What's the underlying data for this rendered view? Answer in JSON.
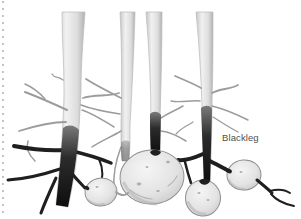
{
  "figure": {
    "label": "Blackleg",
    "alt": "Hand-drawn pencil illustration of four potato stems with blackened lower stems (blackleg disease), fibrous roots and four tubers",
    "colors": {
      "background": "#ffffff",
      "label_text": "#4f4f4f",
      "stem_edge": "#c6c6c6",
      "stem_light": "#f1f1f1",
      "stem_mid": "#dedede",
      "stem_shadow": "#b2b2b2",
      "blackleg_top": "#7a7a7a",
      "blackleg_mid": "#2b2b2b",
      "blackleg_dark": "#0e0e0e",
      "root_dark": "#1f1f1f",
      "root_light": "#9c9c9c",
      "tuber_highlight": "#f5f5f5",
      "tuber_fill": "#e3e3e3",
      "tuber_shade": "#bfbfbf",
      "tuber_outline": "#8f8f8f"
    }
  }
}
